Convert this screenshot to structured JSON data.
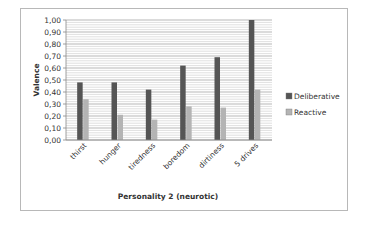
{
  "chart_data": {
    "type": "bar",
    "title": "",
    "xlabel": "Personality 2 (neurotic)",
    "ylabel": "Valence",
    "ylim": [
      0,
      1
    ],
    "yticks": [
      "0,00",
      "0,10",
      "0,20",
      "0,30",
      "0,40",
      "0,50",
      "0,60",
      "0,70",
      "0,80",
      "0,90",
      "1,00"
    ],
    "grid": true,
    "legend_position": "right",
    "categories": [
      "thirst",
      "hunger",
      "tiredness",
      "boredom",
      "dirtiness",
      "5 drives"
    ],
    "series": [
      {
        "name": "Deliberative",
        "color": "#555555",
        "values": [
          0.48,
          0.48,
          0.42,
          0.62,
          0.69,
          1.0
        ]
      },
      {
        "name": "Reactive",
        "color": "#b4b4b4",
        "values": [
          0.34,
          0.21,
          0.17,
          0.28,
          0.27,
          0.42
        ]
      }
    ]
  }
}
